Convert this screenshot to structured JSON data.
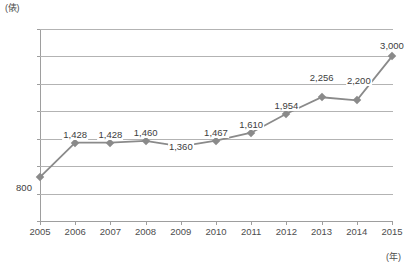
{
  "chart_data": {
    "type": "line",
    "title": "",
    "subtitle": "",
    "xlabel": "(年)",
    "ylabel": "(俵)",
    "categories": [
      "2005",
      "2006",
      "2007",
      "2008",
      "2009",
      "2010",
      "2011",
      "2012",
      "2013",
      "2014",
      "2015"
    ],
    "values": [
      800,
      1428,
      1428,
      1460,
      1360,
      1467,
      1610,
      1954,
      2256,
      2200,
      3000
    ],
    "value_labels": [
      "800",
      "1,428",
      "1,428",
      "1,460",
      "1,360",
      "1,467",
      "1,610",
      "1,954",
      "2,256",
      "2,200",
      "3,000"
    ],
    "ylim": [
      0,
      3500
    ],
    "ytick_values": [
      0,
      500,
      1000,
      1500,
      2000,
      2500,
      3000,
      3500
    ],
    "ytick_labels": [
      "0",
      "500",
      "1,000",
      "1,500",
      "2,000",
      "2,500",
      "3,000",
      "3,500"
    ],
    "grid": true,
    "grid_axis": "y",
    "legend": false,
    "legend_position": "none",
    "series": [
      {
        "name": "",
        "values": [
          800,
          1428,
          1428,
          1460,
          1360,
          1467,
          1610,
          1954,
          2256,
          2200,
          3000
        ],
        "color": "#8a8a8a",
        "marker": "diamond"
      }
    ],
    "colors": {
      "line": "#8a8a8a",
      "marker": "#8a8a8a",
      "grid": "#b3b3b3",
      "axis": "#9e9e9e",
      "text": "#4d4d4d"
    },
    "label_offsets_y": [
      6,
      -13,
      -13,
      -13,
      -4,
      -13,
      -13,
      -13,
      -24,
      -24,
      -15
    ],
    "label_offsets_x": [
      -16,
      0,
      0,
      0,
      0,
      0,
      0,
      0,
      0,
      2,
      0
    ]
  }
}
